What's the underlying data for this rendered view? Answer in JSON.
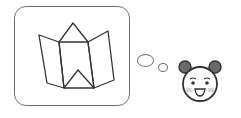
{
  "scene": {
    "description": "Thought bubble containing a folded map icon, emanating from a smiling panda face",
    "icons": {
      "thought_content": "folded-map-icon",
      "character": "panda-face-icon"
    },
    "colors": {
      "outline": "#333333",
      "box_border": "#6e6e6e",
      "ears": "#6a6a6a",
      "cheeks": "#d8d8d8",
      "background": "#ffffff"
    }
  }
}
